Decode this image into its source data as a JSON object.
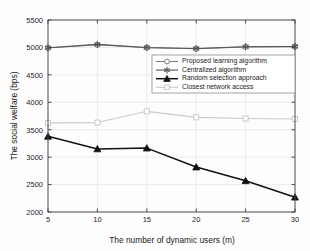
{
  "chart_data": {
    "type": "line",
    "title": "",
    "xlabel": "The number of dynamic users (m)",
    "ylabel": "The social welfare (bps)",
    "x": [
      5,
      10,
      15,
      20,
      25,
      30
    ],
    "xlim": [
      5,
      30
    ],
    "ylim": [
      2000,
      5500
    ],
    "xticks": [
      "5",
      "10",
      "15",
      "20",
      "25",
      "30"
    ],
    "yticks": [
      "2000",
      "2500",
      "3000",
      "3500",
      "4000",
      "4500",
      "5000",
      "5500"
    ],
    "grid": true,
    "legend_position": "center-right",
    "series": [
      {
        "name": "Proposed learning algorithm",
        "values": [
          4990,
          5050,
          4995,
          4975,
          5010,
          5015
        ],
        "color": "#7d7d7d",
        "marker": "circle"
      },
      {
        "name": "Centralized algorithm",
        "values": [
          4995,
          5055,
          4998,
          4980,
          5012,
          5018
        ],
        "color": "#555555",
        "marker": "asterisk"
      },
      {
        "name": "Random selection approach",
        "values": [
          3380,
          3150,
          3165,
          2820,
          2570,
          2270
        ],
        "color": "#111111",
        "marker": "triangle"
      },
      {
        "name": "Closest network access",
        "values": [
          3625,
          3630,
          3835,
          3725,
          3705,
          3695
        ],
        "color": "#c9c9c9",
        "marker": "square"
      }
    ]
  }
}
